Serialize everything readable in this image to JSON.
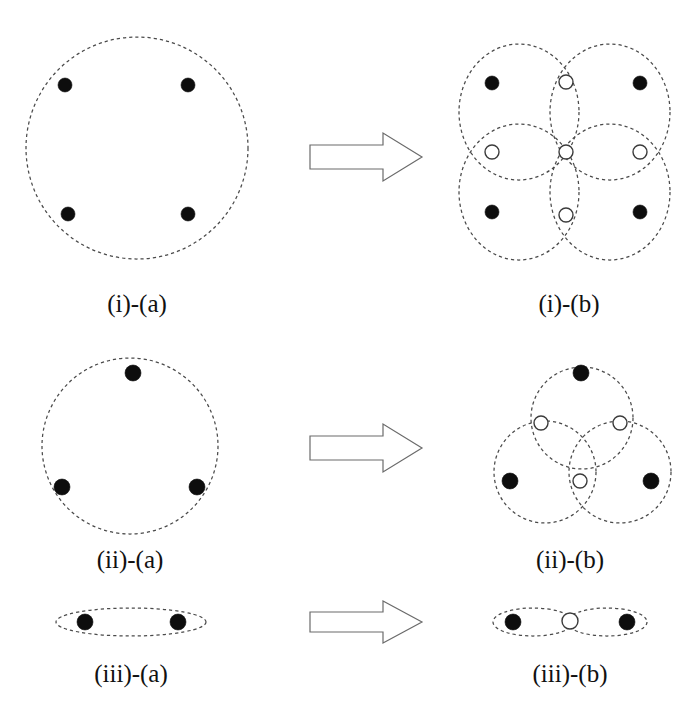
{
  "figure": {
    "background_color": "#ffffff",
    "dash_stroke_color": "#4a4a4a",
    "filled_node_color": "#0d0d0d",
    "open_node_fill": "#ffffff",
    "open_node_stroke": "#3b3b3b",
    "arrow_stroke_color": "#6b6b6b",
    "arrow_fill_color": "#ffffff",
    "caption_color": "#111111"
  },
  "rows": [
    {
      "id": "row-i",
      "left": {
        "caption": "(i)-(a)",
        "caption_x": 137,
        "caption_y": 312,
        "shapes": [
          {
            "kind": "circle",
            "cx": 137,
            "cy": 148,
            "r": 111
          }
        ],
        "filled_nodes": [
          {
            "cx": 65,
            "cy": 85,
            "r": 7
          },
          {
            "cx": 188,
            "cy": 85,
            "r": 7
          },
          {
            "cx": 68,
            "cy": 214,
            "r": 7
          },
          {
            "cx": 188,
            "cy": 214,
            "r": 7
          }
        ],
        "open_nodes": []
      },
      "right": {
        "caption": "(i)-(b)",
        "caption_x": 569,
        "caption_y": 312,
        "shapes": [
          {
            "kind": "ellipse",
            "cx": 519,
            "cy": 112,
            "rx": 60,
            "ry": 68
          },
          {
            "kind": "ellipse",
            "cx": 610,
            "cy": 112,
            "rx": 60,
            "ry": 68
          },
          {
            "kind": "ellipse",
            "cx": 519,
            "cy": 192,
            "rx": 60,
            "ry": 68
          },
          {
            "kind": "ellipse",
            "cx": 610,
            "cy": 192,
            "rx": 60,
            "ry": 68
          }
        ],
        "filled_nodes": [
          {
            "cx": 492,
            "cy": 83,
            "r": 7
          },
          {
            "cx": 640,
            "cy": 83,
            "r": 7
          },
          {
            "cx": 492,
            "cy": 212,
            "r": 7
          },
          {
            "cx": 640,
            "cy": 212,
            "r": 7
          }
        ],
        "open_nodes": [
          {
            "cx": 566,
            "cy": 82,
            "r": 7
          },
          {
            "cx": 566,
            "cy": 215,
            "r": 7
          },
          {
            "cx": 492,
            "cy": 152,
            "r": 7
          },
          {
            "cx": 640,
            "cy": 152,
            "r": 7
          },
          {
            "cx": 566,
            "cy": 152,
            "r": 7
          }
        ]
      },
      "arrow": {
        "x": 310,
        "y": 133,
        "w": 112,
        "h": 48
      }
    },
    {
      "id": "row-ii",
      "left": {
        "caption": "(ii)-(a)",
        "caption_x": 130,
        "caption_y": 568,
        "shapes": [
          {
            "kind": "circle",
            "cx": 130,
            "cy": 446,
            "r": 88
          }
        ],
        "filled_nodes": [
          {
            "cx": 133,
            "cy": 373,
            "r": 8
          },
          {
            "cx": 62,
            "cy": 487,
            "r": 8
          },
          {
            "cx": 197,
            "cy": 487,
            "r": 8
          }
        ],
        "open_nodes": []
      },
      "right": {
        "caption": "(ii)-(b)",
        "caption_x": 570,
        "caption_y": 568,
        "shapes": [
          {
            "kind": "circle",
            "cx": 582,
            "cy": 418,
            "r": 51
          },
          {
            "kind": "circle",
            "cx": 545,
            "cy": 472,
            "r": 51
          },
          {
            "kind": "circle",
            "cx": 620,
            "cy": 472,
            "r": 51
          }
        ],
        "filled_nodes": [
          {
            "cx": 581,
            "cy": 373,
            "r": 8
          },
          {
            "cx": 510,
            "cy": 481,
            "r": 8
          },
          {
            "cx": 651,
            "cy": 481,
            "r": 8
          }
        ],
        "open_nodes": [
          {
            "cx": 541,
            "cy": 423,
            "r": 7
          },
          {
            "cx": 620,
            "cy": 423,
            "r": 7
          },
          {
            "cx": 580,
            "cy": 481,
            "r": 7
          }
        ]
      },
      "arrow": {
        "x": 310,
        "y": 424,
        "w": 112,
        "h": 48
      }
    },
    {
      "id": "row-iii",
      "left": {
        "caption": "(iii)-(a)",
        "caption_x": 131,
        "caption_y": 682,
        "shapes": [
          {
            "kind": "ellipse",
            "cx": 131,
            "cy": 622,
            "rx": 75,
            "ry": 14
          }
        ],
        "filled_nodes": [
          {
            "cx": 85,
            "cy": 622,
            "r": 8
          },
          {
            "cx": 178,
            "cy": 622,
            "r": 8
          }
        ],
        "open_nodes": []
      },
      "right": {
        "caption": "(iii)-(b)",
        "caption_x": 570,
        "caption_y": 682,
        "shapes": [
          {
            "kind": "ellipse",
            "cx": 533,
            "cy": 622,
            "rx": 40,
            "ry": 14
          },
          {
            "kind": "ellipse",
            "cx": 607,
            "cy": 622,
            "rx": 40,
            "ry": 14
          }
        ],
        "filled_nodes": [
          {
            "cx": 513,
            "cy": 622,
            "r": 8
          },
          {
            "cx": 627,
            "cy": 622,
            "r": 8
          }
        ],
        "open_nodes": [
          {
            "cx": 570,
            "cy": 621,
            "r": 8
          }
        ]
      },
      "arrow": {
        "x": 310,
        "y": 601,
        "w": 112,
        "h": 42
      }
    }
  ],
  "captions": {
    "i_a": "(i)-(a)",
    "i_b": "(i)-(b)",
    "ii_a": "(ii)-(a)",
    "ii_b": "(ii)-(b)",
    "iii_a": "(iii)-(a)",
    "iii_b": "(iii)-(b)"
  }
}
